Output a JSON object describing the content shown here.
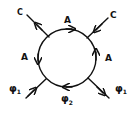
{
  "diagram": {
    "type": "feynman-loop",
    "loop": {
      "center": [
        67,
        58
      ],
      "radius": 29,
      "propagator_label": "A",
      "arrow_direction": "clockwise"
    },
    "labels": {
      "top": "A",
      "left": "A",
      "right": "A",
      "top_left_external": "C",
      "top_right_external": "C",
      "bottom_left_external": "φ",
      "bottom_left_sub": "1",
      "bottom_right_external": "φ",
      "bottom_right_sub": "1",
      "bottom_internal": "φ",
      "bottom_internal_sub": "2"
    },
    "external_lines": [
      {
        "name": "C",
        "position": "top-left",
        "direction": "outgoing"
      },
      {
        "name": "C",
        "position": "top-right",
        "direction": "incoming"
      },
      {
        "name": "φ1",
        "position": "bottom-left",
        "direction": "incoming"
      },
      {
        "name": "φ1",
        "position": "bottom-right",
        "direction": "outgoing"
      }
    ],
    "colors": {
      "ink": "#111111",
      "background": "#ffffff"
    }
  }
}
